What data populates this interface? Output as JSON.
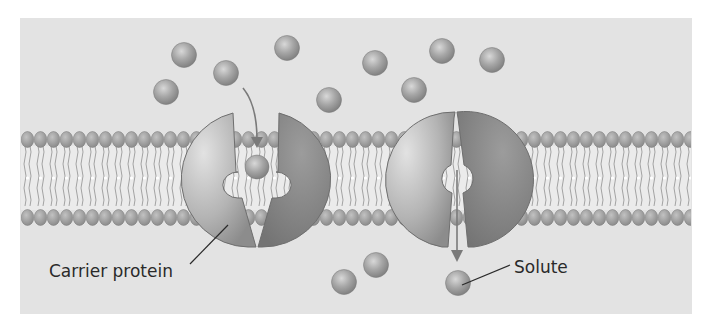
{
  "diagram": {
    "colors": {
      "page": "#ffffff",
      "panel": "#e3e3e3",
      "solute": "#9a9a9a",
      "protein_light": "#c4c4c4",
      "protein_dark": "#8a8a8a",
      "lipid_head": "#a0a0a0",
      "arrow": "#7a7a7a",
      "text": "#2a2a2a"
    },
    "labels": {
      "carrier_protein": "Carrier protein",
      "solute": "Solute"
    },
    "solutes_outside": [
      {
        "x": 184,
        "y": 55
      },
      {
        "x": 226,
        "y": 73
      },
      {
        "x": 166,
        "y": 92
      },
      {
        "x": 287,
        "y": 48
      },
      {
        "x": 329,
        "y": 100
      },
      {
        "x": 375,
        "y": 63
      },
      {
        "x": 442,
        "y": 51
      },
      {
        "x": 414,
        "y": 90
      },
      {
        "x": 492,
        "y": 60
      }
    ],
    "solutes_inside": [
      {
        "x": 344,
        "y": 282
      },
      {
        "x": 376,
        "y": 265
      },
      {
        "x": 458,
        "y": 283
      }
    ],
    "proteins": [
      {
        "name": "carrier-protein-open-outward",
        "cx": 260,
        "cy": 180,
        "r": 68,
        "state": "binding"
      },
      {
        "name": "carrier-protein-open-inward",
        "cx": 457,
        "cy": 180,
        "r": 68,
        "state": "releasing"
      }
    ]
  }
}
